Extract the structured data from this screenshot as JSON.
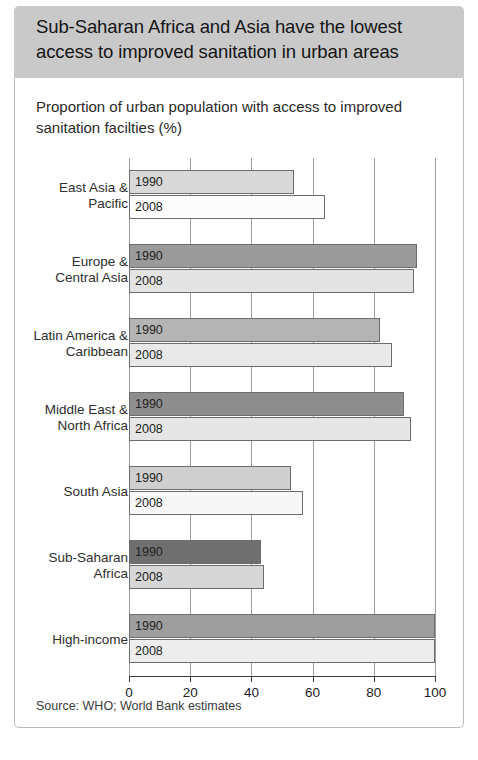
{
  "header": {
    "title": "Sub-Saharan Africa and Asia have the lowest access to improved sanitation in urban areas",
    "background": "#c9c9c9"
  },
  "subtitle": "Proportion of urban population with access to improved sanitation facilties (%)",
  "source": "Source: WHO; World Bank estimates",
  "chart_data": {
    "type": "bar",
    "orientation": "horizontal",
    "title": "Sub-Saharan Africa and Asia have the lowest access to improved sanitation in urban areas",
    "subtitle": "Proportion of urban population with access to improved sanitation facilties (%)",
    "xlabel": "",
    "ylabel": "",
    "xlim": [
      0,
      100
    ],
    "xticks": [
      0,
      20,
      40,
      60,
      80,
      100
    ],
    "grid": true,
    "legend": "none",
    "series_labels": [
      "1990",
      "2008"
    ],
    "categories": [
      "East Asia & Pacific",
      "Europe & Central Asia",
      "Latin America & Caribbean",
      "Middle East & North Africa",
      "South Asia",
      "Sub-Saharan Africa",
      "High-income"
    ],
    "series": [
      {
        "name": "1990",
        "values": [
          54,
          94,
          82,
          90,
          53,
          43,
          100
        ]
      },
      {
        "name": "2008",
        "values": [
          64,
          93,
          86,
          92,
          57,
          44,
          100
        ]
      }
    ],
    "groups": [
      {
        "category": "East Asia & Pacific",
        "label_lines": [
          "East Asia &",
          "Pacific"
        ],
        "bars": [
          {
            "year": "1990",
            "value": 54,
            "fill": "#d9d9d9"
          },
          {
            "year": "2008",
            "value": 64,
            "fill": "#fcfcfc"
          }
        ]
      },
      {
        "category": "Europe & Central Asia",
        "label_lines": [
          "Europe &",
          "Central Asia"
        ],
        "bars": [
          {
            "year": "1990",
            "value": 94,
            "fill": "#9a9a9a"
          },
          {
            "year": "2008",
            "value": 93,
            "fill": "#e4e4e4"
          }
        ]
      },
      {
        "category": "Latin America & Caribbean",
        "label_lines": [
          "Latin America &",
          "Caribbean"
        ],
        "bars": [
          {
            "year": "1990",
            "value": 82,
            "fill": "#b4b4b4"
          },
          {
            "year": "2008",
            "value": 86,
            "fill": "#e9e9e9"
          }
        ]
      },
      {
        "category": "Middle East & North Africa",
        "label_lines": [
          "Middle East &",
          "North Africa"
        ],
        "bars": [
          {
            "year": "1990",
            "value": 90,
            "fill": "#8e8e8e"
          },
          {
            "year": "2008",
            "value": 92,
            "fill": "#e6e6e6"
          }
        ]
      },
      {
        "category": "South Asia",
        "label_lines": [
          "South Asia"
        ],
        "bars": [
          {
            "year": "1990",
            "value": 53,
            "fill": "#cfcfcf"
          },
          {
            "year": "2008",
            "value": 57,
            "fill": "#f7f7f7"
          }
        ]
      },
      {
        "category": "Sub-Saharan Africa",
        "label_lines": [
          "Sub-Saharan",
          "Africa"
        ],
        "bars": [
          {
            "year": "1990",
            "value": 43,
            "fill": "#6f6f6f"
          },
          {
            "year": "2008",
            "value": 44,
            "fill": "#d7d7d7"
          }
        ]
      },
      {
        "category": "High-income",
        "label_lines": [
          "High-income"
        ],
        "bars": [
          {
            "year": "1990",
            "value": 100,
            "fill": "#9e9e9e"
          },
          {
            "year": "2008",
            "value": 100,
            "fill": "#ededed"
          }
        ]
      }
    ]
  }
}
